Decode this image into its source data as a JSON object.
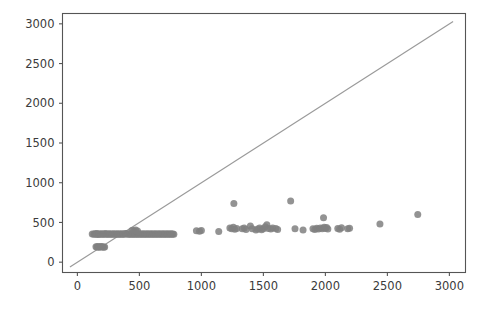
{
  "chart_data": {
    "type": "scatter",
    "title": "",
    "xlabel": "",
    "ylabel": "",
    "xlim": [
      -120,
      3130
    ],
    "ylim": [
      -130,
      3130
    ],
    "grid": false,
    "legend": null,
    "xticks": [
      0,
      500,
      1000,
      1500,
      2000,
      2500,
      3000
    ],
    "yticks": [
      0,
      500,
      1000,
      1500,
      2000,
      2500,
      3000
    ],
    "xtick_labels": [
      "0",
      "500",
      "1000",
      "1500",
      "2000",
      "2500",
      "3000"
    ],
    "ytick_labels": [
      "0",
      "500",
      "1000",
      "1500",
      "2000",
      "2500",
      "3000"
    ],
    "point_color": "#808080",
    "line_color": "#9a9a9a",
    "axis_color": "#555555",
    "background_color": "#ffffff",
    "marker_size": 7,
    "annotations": [],
    "series": [
      {
        "name": "identity-line",
        "type": "line",
        "x": [
          -60,
          3030
        ],
        "y": [
          -60,
          3030
        ]
      },
      {
        "name": "observations",
        "type": "scatter",
        "points": [
          [
            120,
            355
          ],
          [
            132,
            352
          ],
          [
            140,
            358
          ],
          [
            148,
            350
          ],
          [
            155,
            360
          ],
          [
            160,
            352
          ],
          [
            165,
            356
          ],
          [
            170,
            350
          ],
          [
            150,
            195
          ],
          [
            158,
            190
          ],
          [
            165,
            198
          ],
          [
            172,
            188
          ],
          [
            180,
            192
          ],
          [
            188,
            196
          ],
          [
            196,
            190
          ],
          [
            204,
            194
          ],
          [
            212,
            188
          ],
          [
            220,
            192
          ],
          [
            178,
            356
          ],
          [
            186,
            350
          ],
          [
            194,
            358
          ],
          [
            202,
            352
          ],
          [
            210,
            356
          ],
          [
            218,
            350
          ],
          [
            226,
            360
          ],
          [
            234,
            352
          ],
          [
            242,
            356
          ],
          [
            250,
            350
          ],
          [
            258,
            358
          ],
          [
            266,
            352
          ],
          [
            274,
            356
          ],
          [
            282,
            350
          ],
          [
            290,
            358
          ],
          [
            298,
            352
          ],
          [
            306,
            356
          ],
          [
            314,
            350
          ],
          [
            322,
            358
          ],
          [
            330,
            352
          ],
          [
            338,
            356
          ],
          [
            346,
            350
          ],
          [
            354,
            358
          ],
          [
            362,
            352
          ],
          [
            370,
            356
          ],
          [
            378,
            350
          ],
          [
            386,
            360
          ],
          [
            394,
            354
          ],
          [
            402,
            358
          ],
          [
            410,
            352
          ],
          [
            418,
            356
          ],
          [
            426,
            350
          ],
          [
            434,
            358
          ],
          [
            442,
            352
          ],
          [
            450,
            356
          ],
          [
            458,
            350
          ],
          [
            466,
            358
          ],
          [
            474,
            352
          ],
          [
            482,
            356
          ],
          [
            490,
            350
          ],
          [
            498,
            358
          ],
          [
            506,
            352
          ],
          [
            514,
            356
          ],
          [
            522,
            350
          ],
          [
            530,
            358
          ],
          [
            538,
            352
          ],
          [
            546,
            356
          ],
          [
            554,
            350
          ],
          [
            562,
            358
          ],
          [
            570,
            352
          ],
          [
            578,
            356
          ],
          [
            586,
            350
          ],
          [
            594,
            358
          ],
          [
            602,
            352
          ],
          [
            610,
            356
          ],
          [
            618,
            350
          ],
          [
            626,
            358
          ],
          [
            634,
            352
          ],
          [
            642,
            356
          ],
          [
            650,
            350
          ],
          [
            658,
            358
          ],
          [
            666,
            352
          ],
          [
            674,
            356
          ],
          [
            682,
            350
          ],
          [
            690,
            358
          ],
          [
            698,
            352
          ],
          [
            706,
            356
          ],
          [
            714,
            350
          ],
          [
            722,
            358
          ],
          [
            730,
            352
          ],
          [
            738,
            356
          ],
          [
            746,
            350
          ],
          [
            754,
            358
          ],
          [
            762,
            352
          ],
          [
            770,
            356
          ],
          [
            778,
            350
          ],
          [
            440,
            400
          ],
          [
            455,
            395
          ],
          [
            470,
            405
          ],
          [
            485,
            392
          ],
          [
            960,
            395
          ],
          [
            985,
            388
          ],
          [
            1000,
            400
          ],
          [
            1140,
            385
          ],
          [
            1230,
            430
          ],
          [
            1245,
            420
          ],
          [
            1258,
            440
          ],
          [
            1270,
            415
          ],
          [
            1285,
            425
          ],
          [
            1262,
            740
          ],
          [
            1330,
            420
          ],
          [
            1345,
            430
          ],
          [
            1360,
            412
          ],
          [
            1395,
            455
          ],
          [
            1410,
            420
          ],
          [
            1440,
            405
          ],
          [
            1455,
            418
          ],
          [
            1470,
            430
          ],
          [
            1485,
            408
          ],
          [
            1500,
            420
          ],
          [
            1515,
            445
          ],
          [
            1528,
            470
          ],
          [
            1540,
            425
          ],
          [
            1560,
            418
          ],
          [
            1575,
            430
          ],
          [
            1600,
            425
          ],
          [
            1615,
            412
          ],
          [
            1720,
            770
          ],
          [
            1755,
            420
          ],
          [
            1820,
            405
          ],
          [
            1900,
            420
          ],
          [
            1915,
            412
          ],
          [
            1930,
            428
          ],
          [
            1945,
            418
          ],
          [
            1960,
            430
          ],
          [
            1975,
            420
          ],
          [
            1990,
            440
          ],
          [
            2000,
            425
          ],
          [
            2010,
            435
          ],
          [
            2020,
            418
          ],
          [
            1985,
            560
          ],
          [
            2100,
            425
          ],
          [
            2115,
            415
          ],
          [
            2130,
            432
          ],
          [
            2180,
            420
          ],
          [
            2195,
            428
          ],
          [
            2440,
            480
          ],
          [
            2745,
            600
          ]
        ]
      }
    ]
  }
}
